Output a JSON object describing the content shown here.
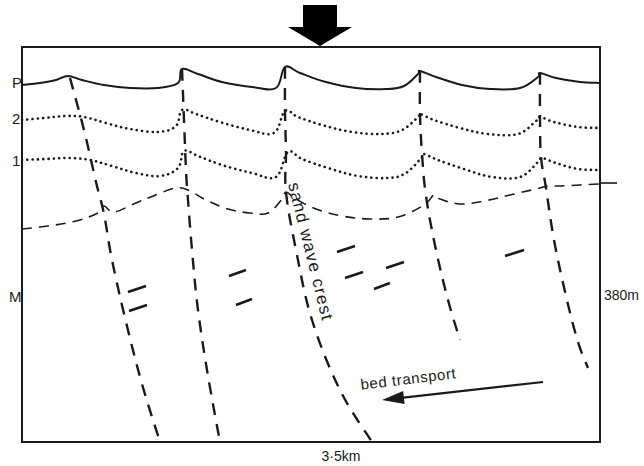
{
  "figure": {
    "name": "seismic-profile-sand-waves",
    "frame": {
      "x": 22,
      "y": 47,
      "width": 578,
      "height": 395,
      "stroke": "#1a1a1a"
    },
    "background": "#ffffff",
    "ink": "#1a1a1a"
  },
  "top_arrow": {
    "name": "current-direction-arrow",
    "description": "solid black downward arrow above section",
    "x_center": 320,
    "y_top": 5,
    "y_bottom": 46,
    "color": "#000000"
  },
  "axis_labels": {
    "left": [
      {
        "id": "P",
        "text": "P",
        "x": 12,
        "y": 88
      },
      {
        "id": "2",
        "text": "2",
        "x": 12,
        "y": 124
      },
      {
        "id": "1",
        "text": "1",
        "x": 12,
        "y": 166
      },
      {
        "id": "M",
        "text": "M",
        "x": 9,
        "y": 302
      }
    ],
    "right": [
      {
        "id": "depth",
        "text": "380m",
        "x": 604,
        "y": 300
      }
    ],
    "bottom": [
      {
        "id": "scale",
        "text": "3·5km",
        "x": 341,
        "y": 461
      }
    ]
  },
  "right_tick": {
    "name": "right-edge-tick",
    "x1": 600,
    "x2": 617,
    "y": 183
  },
  "annotations": [
    {
      "id": "sand-wave-crest",
      "text": "sand wave crest",
      "x": 288,
      "y": 184,
      "rotation": 76,
      "font_size": 17
    },
    {
      "id": "bed-transport",
      "text": "bed transport",
      "x": 409,
      "y": 384,
      "rotation": -7,
      "font_size": 15
    }
  ],
  "transport_arrow": {
    "name": "bed-transport-arrow",
    "x_tail": 543,
    "y_tail": 382,
    "x_head": 382,
    "y_head": 400,
    "color": "#1a1a1a"
  },
  "horizons": [
    {
      "id": "P",
      "label": "P",
      "style": "solid",
      "stroke_width": 2.0,
      "description": "seabed, undulating sand wave surface",
      "points": "22,85 40,83 56,80 68,76 82,80 104,85 130,88 158,88 178,83 182,69 198,74 222,82 252,87 276,88 285,67 300,73 326,82 356,88 386,89 404,86 418,74 420,71 436,77 462,85 490,89 520,88 538,77 540,73 556,78 580,82 600,83"
    },
    {
      "id": "2",
      "label": "2",
      "style": "dotted",
      "stroke_width": 2.6,
      "description": "first dotted reflector horizon",
      "points": "22,120 44,118 66,116 84,117 106,123 130,129 158,132 176,126 182,110 196,114 220,122 250,130 274,133 285,111 298,117 322,125 352,132 382,134 402,130 418,117 420,114 434,120 460,128 488,134 518,134 536,121 540,117 554,122 578,127 600,128"
    },
    {
      "id": "1",
      "label": "1",
      "style": "dotted",
      "stroke_width": 2.6,
      "description": "second dotted reflector horizon",
      "points": "22,160 46,159 70,158 90,160 112,166 136,173 160,176 178,168 184,151 198,156 222,165 252,173 276,177 288,152 302,159 328,168 358,176 388,178 406,173 422,157 424,154 438,160 464,169 492,177 520,177 538,162 542,158 556,163 578,169 600,170"
    },
    {
      "id": "M",
      "label": "M",
      "style": "dashed",
      "stroke_width": 1.6,
      "dash": "10,7",
      "description": "lower dashed unconformity horizon",
      "points": "22,229 48,226 76,221 98,213 104,206 114,212 136,203 158,194 176,188 188,190 206,200 228,209 250,213 268,213 282,199 286,192 296,199 316,209 342,216 370,219 398,217 424,205 434,195 440,199 460,204 484,201 510,195 536,189 548,186 560,186 580,185 600,184"
    }
  ],
  "faults": [
    {
      "id": "fault-1",
      "style": "dashed",
      "stroke_width": 2.4,
      "dash": "12,9",
      "points": "70,78 84,130 96,182 104,214 112,260 126,322 142,384 160,442"
    },
    {
      "id": "fault-2",
      "style": "dashed",
      "stroke_width": 2.4,
      "dash": "12,9",
      "points": "182,69 184,120 186,170 188,200 192,250 198,310 208,376 220,442"
    },
    {
      "id": "fault-3",
      "style": "dashed",
      "stroke_width": 2.4,
      "dash": "12,9",
      "points": "285,67 285,112 286,152 286,192 296,250 312,320 340,390 372,442"
    },
    {
      "id": "fault-4",
      "style": "dashed",
      "stroke_width": 2.4,
      "dash": "12,9",
      "points": "420,71 420,114 422,154 426,196 436,250 448,300 460,340"
    },
    {
      "id": "fault-5",
      "style": "dashed",
      "stroke_width": 2.4,
      "dash": "12,9",
      "points": "540,73 540,117 541,157 546,188 554,240 566,296 578,342 588,368"
    }
  ],
  "reflector_ticks": [
    {
      "id": "tick-1",
      "x1": 128,
      "y1": 292,
      "x2": 146,
      "y2": 286
    },
    {
      "id": "tick-2",
      "x1": 129,
      "y1": 311,
      "x2": 147,
      "y2": 305
    },
    {
      "id": "tick-3",
      "x1": 229,
      "y1": 276,
      "x2": 246,
      "y2": 270
    },
    {
      "id": "tick-4",
      "x1": 236,
      "y1": 305,
      "x2": 252,
      "y2": 299
    },
    {
      "id": "tick-5",
      "x1": 337,
      "y1": 252,
      "x2": 355,
      "y2": 246
    },
    {
      "id": "tick-6",
      "x1": 345,
      "y1": 278,
      "x2": 363,
      "y2": 272
    },
    {
      "id": "tick-7",
      "x1": 386,
      "y1": 268,
      "x2": 404,
      "y2": 262
    },
    {
      "id": "tick-8",
      "x1": 374,
      "y1": 289,
      "x2": 390,
      "y2": 283
    },
    {
      "id": "tick-9",
      "x1": 505,
      "y1": 256,
      "x2": 524,
      "y2": 250
    }
  ]
}
